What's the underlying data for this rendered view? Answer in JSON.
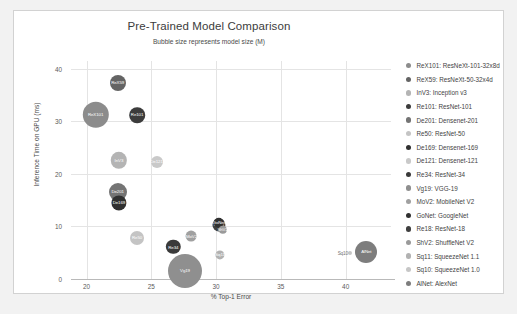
{
  "chart_data": {
    "type": "scatter",
    "title": "Pre-Trained Model Comparison",
    "subtitle": "Bubble size represents model size (M)",
    "xlabel": "% Top-1 Error",
    "ylabel": "Inference Time on GPU (ms)",
    "xlim": [
      18.8,
      43.5
    ],
    "ylim": [
      0,
      41.5
    ],
    "xticks": [
      "20",
      "25",
      "30",
      "35",
      "40"
    ],
    "xtick_values": [
      20,
      25,
      30,
      35,
      40
    ],
    "yticks": [
      "0",
      "10",
      "20",
      "30",
      "40"
    ],
    "ytick_values": [
      0,
      10,
      20,
      30,
      40
    ],
    "grid": true,
    "legend_position": "right",
    "size_encoding": "model size (M parameters)",
    "points": [
      {
        "key": "ReX101",
        "label": "ReX101",
        "x": 20.7,
        "y": 31.3,
        "size": 88,
        "radius": 13.2,
        "color": "#8c8c8c",
        "label_inside": true
      },
      {
        "key": "ReX59",
        "label": "ReX59",
        "x": 22.4,
        "y": 37.4,
        "size": 25,
        "radius": 8.0,
        "color": "#646464",
        "label_inside": true
      },
      {
        "key": "InV3",
        "label": "InV3",
        "x": 22.5,
        "y": 22.6,
        "size": 27,
        "radius": 8.2,
        "color": "#b4b4b4",
        "label_inside": true
      },
      {
        "key": "Re101",
        "label": "Re101",
        "x": 23.9,
        "y": 31.2,
        "size": 45,
        "radius": 7.8,
        "color": "#3c3c3c",
        "label_inside": true
      },
      {
        "key": "De201",
        "label": "De201",
        "x": 22.4,
        "y": 16.6,
        "size": 20,
        "radius": 9.0,
        "color": "#747474",
        "label_inside": true
      },
      {
        "key": "Re50",
        "label": "Re50",
        "x": 23.9,
        "y": 7.9,
        "size": 26,
        "radius": 7.0,
        "color": "#c4c4c4",
        "label_inside": true
      },
      {
        "key": "De169",
        "label": "De169",
        "x": 22.5,
        "y": 14.5,
        "size": 14,
        "radius": 7.6,
        "color": "#303030",
        "label_inside": true
      },
      {
        "key": "De121",
        "label": "De121",
        "x": 25.4,
        "y": 22.3,
        "size": 8,
        "radius": 6.0,
        "color": "#c9c9c9",
        "label_inside": true
      },
      {
        "key": "Re34",
        "label": "Re34",
        "x": 26.7,
        "y": 6.1,
        "size": 22,
        "radius": 7.2,
        "color": "#3a3a3a",
        "label_inside": true
      },
      {
        "key": "Vg19",
        "label": "Vg19",
        "x": 27.6,
        "y": 1.6,
        "size": 144,
        "radius": 17.0,
        "color": "#8f8f8f",
        "label_inside": true
      },
      {
        "key": "MoV2",
        "label": "MoV2",
        "x": 28.1,
        "y": 8.2,
        "size": 4,
        "radius": 5.4,
        "color": "#a0a0a0",
        "label_inside": true
      },
      {
        "key": "GoNet",
        "label": "GoNet",
        "x": 30.2,
        "y": 10.7,
        "size": 7,
        "radius": 5.2,
        "color": "#303030",
        "label_inside": true
      },
      {
        "key": "Re18",
        "label": "Re18",
        "x": 30.2,
        "y": 10.3,
        "size": 12,
        "radius": 6.6,
        "color": "#3f3f3f",
        "label_inside": true
      },
      {
        "key": "ShV2",
        "label": "ShV2",
        "x": 30.5,
        "y": 9.4,
        "size": 2,
        "radius": 4.2,
        "color": "#9a9a9a",
        "label_inside": true
      },
      {
        "key": "Sq11",
        "label": "Sq11",
        "x": 30.3,
        "y": 4.6,
        "size": 1.2,
        "radius": 4.6,
        "color": "#b2b2b2",
        "label_inside": true
      },
      {
        "key": "Sq10",
        "label": "Sq10",
        "x": 40.3,
        "y": 5.0,
        "size": 1.2,
        "radius": 2.0,
        "color": "#c6c6c6",
        "label_inside": false
      },
      {
        "key": "AlNet",
        "label": "AlNet",
        "x": 41.6,
        "y": 5.2,
        "size": 61,
        "radius": 11.0,
        "color": "#7d7d7d",
        "label_inside": true
      }
    ],
    "legend": [
      {
        "key": "ReX101",
        "text": "ReX101: ResNeXt-101-32x8d",
        "color": "#8c8c8c"
      },
      {
        "key": "ReX59",
        "text": "ReX59: ResNeXt-50-32x4d",
        "color": "#646464"
      },
      {
        "key": "InV3",
        "text": "InV3: Inception v3",
        "color": "#b4b4b4"
      },
      {
        "key": "Re101",
        "text": "Re101: ResNet-101",
        "color": "#3c3c3c"
      },
      {
        "key": "De201",
        "text": "De201: Densenet-201",
        "color": "#747474"
      },
      {
        "key": "Re50",
        "text": "Re50: ResNet-50",
        "color": "#c4c4c4"
      },
      {
        "key": "De169",
        "text": "De169: Densenet-169",
        "color": "#303030"
      },
      {
        "key": "De121",
        "text": "De121: Densenet-121",
        "color": "#c9c9c9"
      },
      {
        "key": "Re34",
        "text": "Re34: ResNet-34",
        "color": "#3a3a3a"
      },
      {
        "key": "Vg19",
        "text": "Vg19: VGG-19",
        "color": "#8f8f8f"
      },
      {
        "key": "MoV2",
        "text": "MoV2: MobileNet V2",
        "color": "#a0a0a0"
      },
      {
        "key": "GoNet",
        "text": "GoNet: GoogleNet",
        "color": "#303030"
      },
      {
        "key": "Re18",
        "text": "Re18: ResNet-18",
        "color": "#3f3f3f"
      },
      {
        "key": "ShV2",
        "text": "ShV2: ShuffleNet V2",
        "color": "#9a9a9a"
      },
      {
        "key": "Sq11",
        "text": "Sq11: SqueezeNet 1.1",
        "color": "#b2b2b2"
      },
      {
        "key": "Sq10",
        "text": "Sq10: SqueezeNet 1.0",
        "color": "#c6c6c6"
      },
      {
        "key": "AlNet",
        "text": "AlNet: AlexNet",
        "color": "#7d7d7d"
      }
    ]
  }
}
